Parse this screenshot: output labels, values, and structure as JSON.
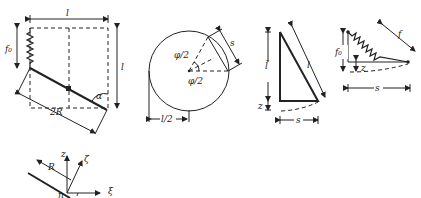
{
  "figure_a": {
    "label_l_top": "l",
    "label_f0": "f₀",
    "label_l_right": "l",
    "label_alpha": "α",
    "label_2R": "2R"
  },
  "figure_b": {
    "label_phi_upper": "φ/2",
    "label_phi_lower": "φ/2",
    "label_s": "s",
    "label_l_half": "l/2"
  },
  "figure_c": {
    "label_l_tilde": "l̃",
    "label_l_hyp": "l",
    "label_z": "z",
    "label_s": "s"
  },
  "figure_d": {
    "label_f0": "f₀",
    "label_z": "z",
    "label_f": "f",
    "label_s": "s"
  },
  "figure_e": {
    "label_z": "z",
    "label_zeta": "ζ",
    "label_R": "R",
    "label_xi": "ξ",
    "label_n": "n"
  }
}
